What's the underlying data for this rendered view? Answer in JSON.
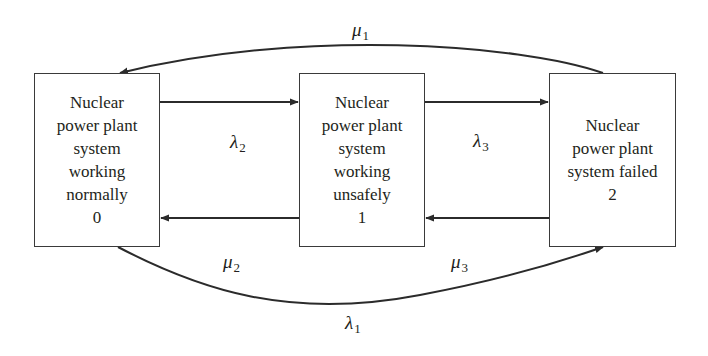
{
  "diagram": {
    "type": "state-transition",
    "line_color": "#2b2b2b",
    "states": [
      {
        "id": "0",
        "lines": [
          "Nuclear",
          "power plant",
          "system",
          "working",
          "normally",
          "0"
        ]
      },
      {
        "id": "1",
        "lines": [
          "Nuclear",
          "power plant",
          "system",
          "working",
          "unsafely",
          "1"
        ]
      },
      {
        "id": "2",
        "lines": [
          "Nuclear",
          "power plant",
          "system failed",
          "2"
        ]
      }
    ],
    "transitions": [
      {
        "from": "0",
        "to": "1",
        "symbol": "λ",
        "subscript": "2"
      },
      {
        "from": "1",
        "to": "2",
        "symbol": "λ",
        "subscript": "3"
      },
      {
        "from": "1",
        "to": "0",
        "symbol": "μ",
        "subscript": "2"
      },
      {
        "from": "2",
        "to": "1",
        "symbol": "μ",
        "subscript": "3"
      },
      {
        "from": "2",
        "to": "0",
        "symbol": "μ",
        "subscript": "1"
      },
      {
        "from": "0",
        "to": "2",
        "symbol": "λ",
        "subscript": "1"
      }
    ]
  }
}
